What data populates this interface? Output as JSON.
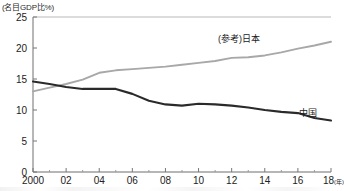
{
  "chart_data": {
    "type": "line",
    "title": "",
    "ylabel": "(名目GDP比%)",
    "xlabel": "(年)",
    "ylim": [
      0,
      25
    ],
    "xlim": [
      2000,
      2018
    ],
    "yticks": [
      0,
      5,
      10,
      15,
      20,
      25
    ],
    "ytick_labels": [
      "0",
      "5",
      "10",
      "15",
      "20",
      "25"
    ],
    "xticks": [
      2000,
      2002,
      2004,
      2006,
      2008,
      2010,
      2012,
      2014,
      2016,
      2018
    ],
    "xtick_labels": [
      "2000",
      "02",
      "04",
      "06",
      "08",
      "10",
      "12",
      "14",
      "16",
      "18"
    ],
    "xtick_minor": [
      2001,
      2003,
      2005,
      2007,
      2009,
      2011,
      2013,
      2015,
      2017
    ],
    "x_unit_label": "(年)",
    "grid": false,
    "legend": "inline-end-labels",
    "x": [
      2000,
      2001,
      2002,
      2003,
      2004,
      2005,
      2006,
      2007,
      2008,
      2009,
      2010,
      2011,
      2012,
      2013,
      2014,
      2015,
      2016,
      2017,
      2018
    ],
    "series": [
      {
        "name": "(参考)日本",
        "color": "#a8a8a8",
        "values": [
          13.0,
          13.6,
          14.2,
          14.9,
          16.0,
          16.4,
          16.6,
          16.8,
          17.0,
          17.3,
          17.6,
          17.9,
          18.4,
          18.5,
          18.8,
          19.3,
          19.9,
          20.4,
          21.0
        ]
      },
      {
        "name": "中国",
        "color": "#2a2a2a",
        "values": [
          14.6,
          14.2,
          13.7,
          13.4,
          13.4,
          13.4,
          12.6,
          11.5,
          10.9,
          10.7,
          11.0,
          10.9,
          10.7,
          10.4,
          10.0,
          9.7,
          9.5,
          8.7,
          8.3
        ]
      }
    ]
  },
  "labels": {
    "japan": "(参考)日本",
    "china": "中国"
  }
}
